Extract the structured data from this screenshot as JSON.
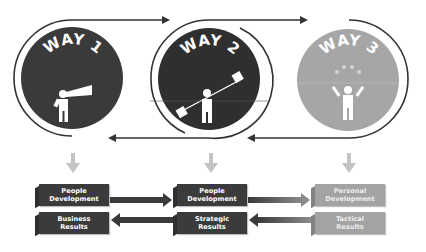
{
  "ways": [
    {
      "label": "WAY 1",
      "icon": "telescope-person-icon",
      "fill": "#3a3a3a"
    },
    {
      "label": "WAY 2",
      "icon": "flag-signal-person-icon",
      "fill": "#2f2f2f"
    },
    {
      "label": "WAY 3",
      "icon": "juggling-person-icon",
      "fill": "#a6a6a6"
    }
  ],
  "columns": [
    {
      "top": {
        "line1": "People",
        "line2": "Development"
      },
      "bottom": {
        "line1": "Business",
        "line2": "Results"
      },
      "style": "dark"
    },
    {
      "top": {
        "line1": "People",
        "line2": "Development"
      },
      "bottom": {
        "line1": "Strategic",
        "line2": "Results"
      },
      "style": "dark"
    },
    {
      "top": {
        "line1": "Personal",
        "line2": "Development"
      },
      "bottom": {
        "line1": "Tactical",
        "line2": "Results"
      },
      "style": "light"
    }
  ],
  "colors": {
    "dark": "#3a3a3a",
    "light": "#a6a6a6",
    "arrow_down": "#c4c4c4",
    "line": "#333333"
  }
}
